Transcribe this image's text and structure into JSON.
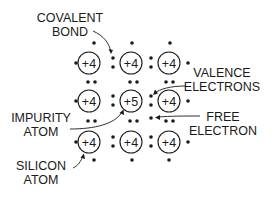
{
  "diagram": {
    "type": "n-type semiconductor crystal lattice",
    "atoms": [
      {
        "row": 0,
        "col": 0,
        "label": "+4",
        "kind": "silicon"
      },
      {
        "row": 0,
        "col": 1,
        "label": "+4",
        "kind": "silicon"
      },
      {
        "row": 0,
        "col": 2,
        "label": "+4",
        "kind": "silicon"
      },
      {
        "row": 1,
        "col": 0,
        "label": "+4",
        "kind": "silicon"
      },
      {
        "row": 1,
        "col": 1,
        "label": "+5",
        "kind": "impurity"
      },
      {
        "row": 1,
        "col": 2,
        "label": "+4",
        "kind": "silicon"
      },
      {
        "row": 2,
        "col": 0,
        "label": "+4",
        "kind": "silicon"
      },
      {
        "row": 2,
        "col": 1,
        "label": "+4",
        "kind": "silicon"
      },
      {
        "row": 2,
        "col": 2,
        "label": "+4",
        "kind": "silicon"
      }
    ],
    "labels": {
      "covalent_bond": {
        "line1": "COVALENT",
        "line2": "BOND"
      },
      "valence_electrons": {
        "line1": "VALENCE",
        "line2": "ELECTRONS"
      },
      "impurity_atom": {
        "line1": "IMPURITY",
        "line2": "ATOM"
      },
      "free_electron": {
        "line1": "FREE",
        "line2": "ELECTRON"
      },
      "silicon_atom": {
        "line1": "SILICON",
        "line2": "ATOM"
      }
    }
  }
}
